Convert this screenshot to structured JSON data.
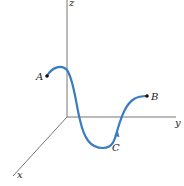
{
  "diagram": {
    "type": "3d-space-curve",
    "axes": {
      "x": {
        "label": "x"
      },
      "y": {
        "label": "y"
      },
      "z": {
        "label": "z"
      }
    },
    "points": [
      {
        "id": "A",
        "label": "A"
      },
      {
        "id": "B",
        "label": "B"
      },
      {
        "id": "C",
        "label": "C"
      }
    ],
    "curve": {
      "color": "#3a7cc0",
      "from": "A",
      "to": "B",
      "via": "C",
      "direction_arrow": "toward B"
    },
    "axis_color": "#777777",
    "point_color": "#111111"
  }
}
